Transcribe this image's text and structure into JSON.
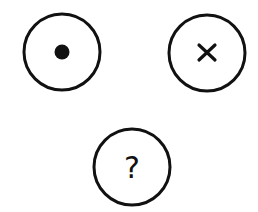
{
  "diagram": {
    "background": "#ffffff",
    "stroke_color": "#111111",
    "nodes": [
      {
        "id": "dot-node",
        "symbol": "dot-icon",
        "cx": 62,
        "cy": 52,
        "r": 38
      },
      {
        "id": "x-node",
        "symbol": "x-icon",
        "cx": 207,
        "cy": 53,
        "r": 38
      },
      {
        "id": "question-node",
        "symbol": "question-icon",
        "label": "?",
        "cx": 132,
        "cy": 167,
        "r": 38
      }
    ]
  }
}
